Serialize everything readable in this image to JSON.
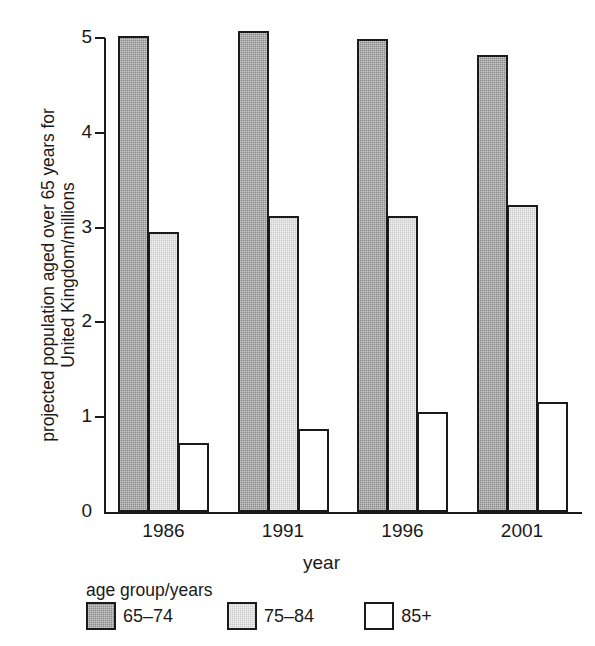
{
  "chart_data": {
    "type": "bar",
    "title": "",
    "xlabel": "year",
    "ylabel": "projected population aged over 65 years for United Kingdom/millions",
    "ylabel_lines": [
      "projected population aged over 65 years for",
      "United Kingdom/millions"
    ],
    "categories": [
      "1986",
      "1991",
      "1996",
      "2001"
    ],
    "series": [
      {
        "name": "65–74",
        "values": [
          5.02,
          5.07,
          4.99,
          4.82
        ],
        "fill": "dark-gray-hatch",
        "color": "#8a8a8a"
      },
      {
        "name": "75–84",
        "values": [
          2.95,
          3.12,
          3.12,
          3.24
        ],
        "fill": "light-gray-hatch",
        "color": "#c9c9c9"
      },
      {
        "name": "85+",
        "values": [
          0.73,
          0.88,
          1.05,
          1.16
        ],
        "fill": "white",
        "color": "#ffffff"
      }
    ],
    "ylim": [
      0,
      5
    ],
    "yticks": [
      0,
      1,
      2,
      3,
      4,
      5
    ],
    "ytick_labels": [
      "0",
      "1",
      "2",
      "3",
      "4",
      "5"
    ],
    "grid": false,
    "legend_position": "below-axes",
    "legend_title": "age group/years"
  }
}
